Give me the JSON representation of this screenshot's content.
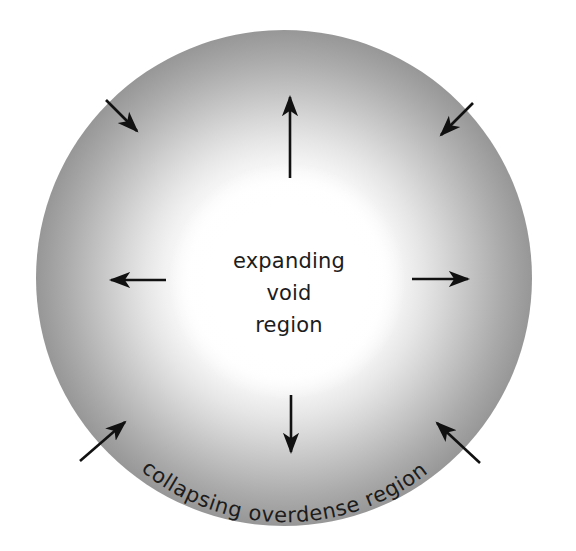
{
  "figure": {
    "background_color": "#ffffff",
    "outer_disc": {
      "center_x": 284,
      "center_y": 278,
      "radius": 248,
      "edge_color": "#9a9a9a",
      "inner_color": "#ffffff"
    },
    "void": {
      "center_x": 287,
      "center_y": 281,
      "radius": 100,
      "color": "#ffffff"
    }
  },
  "labels": {
    "void_lines": [
      "expanding",
      "void",
      "region"
    ],
    "ring_text": "collapsing overdense region",
    "ring_text_color": "#1c1c1c"
  },
  "arrows": {
    "outward": [
      {
        "name": "arrow-outward-up",
        "angle_deg": -90,
        "label": "up"
      },
      {
        "name": "arrow-outward-right",
        "angle_deg": 0,
        "label": "right"
      },
      {
        "name": "arrow-outward-down",
        "angle_deg": 90,
        "label": "down"
      },
      {
        "name": "arrow-outward-left",
        "angle_deg": 180,
        "label": "left"
      }
    ],
    "inward": [
      {
        "name": "arrow-inward-upper-left",
        "angle_deg": 215,
        "label": "upper-left"
      },
      {
        "name": "arrow-inward-upper-right",
        "angle_deg": 325,
        "label": "upper-right"
      },
      {
        "name": "arrow-inward-lower-left",
        "angle_deg": 145,
        "label": "lower-left"
      },
      {
        "name": "arrow-inward-lower-right",
        "angle_deg": 35,
        "label": "lower-right"
      }
    ],
    "stroke_color": "#111111"
  }
}
